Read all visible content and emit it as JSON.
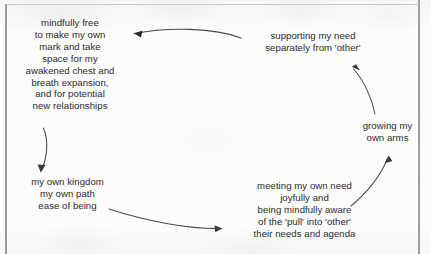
{
  "page": {
    "background_color": "#fbfbfa",
    "frame_color": "#8e8e90",
    "ink_color": "#3b3b40",
    "width": 431,
    "height": 254
  },
  "nodes": {
    "mindfully_free": {
      "label": "mindfully free\nto make my own\nmark and take\nspace for my\nawakened chest and\nbreath expansion,\nand for potential\nnew relationships",
      "position": "top-left"
    },
    "supporting_my_need": {
      "label": "supporting my need\nseparately from 'other'",
      "position": "top-right"
    },
    "growing_my_own_arms": {
      "label": "growing my\nown arms",
      "position": "middle-right"
    },
    "meeting_my_own_need": {
      "label": "meeting my own need\njoyfully and\nbeing mindfully aware\nof the 'pull' into 'other'\ntheir needs and agenda",
      "position": "bottom-right"
    },
    "my_own_kingdom": {
      "label": "my own kingdom\nmy own path\nease of being",
      "position": "bottom-left"
    }
  },
  "arrows": [
    {
      "name": "arrow-top-right-to-left",
      "from": "supporting_my_need",
      "to": "mindfully_free",
      "path": "M 241 38 C 214 27.5 168 27 134 33.5",
      "head": "M 134 33.5 L 141.5 31.2 L 140.2 36.8 Z",
      "multicolor": true,
      "color_stops": [
        "#3a3a42",
        "#2f7f74",
        "#c06c6c",
        "#6a62b5",
        "#4a4a80"
      ]
    },
    {
      "name": "arrow-left-down",
      "from": "mindfully_free",
      "to": "my_own_kingdom",
      "path": "M 43 128 C 49 142 46 160 40.5 171",
      "head": "M 40.5 171 L 44.5 165.5 L 38.2 165.0 Z",
      "multicolor": false,
      "color_stops": [
        "#4a4a50"
      ]
    },
    {
      "name": "arrow-bottom-left-to-right",
      "from": "my_own_kingdom",
      "to": "meeting_my_own_need",
      "path": "M 109 209 C 146 221 188 229 221 228.5",
      "head": "M 221 228.5 L 214.5 225.5 L 215.0 231.5 Z",
      "multicolor": false,
      "color_stops": [
        "#4a4a50"
      ]
    },
    {
      "name": "arrow-bottom-right-up",
      "from": "meeting_my_own_need",
      "to": "growing_my_own_arms",
      "path": "M 351 206 C 368 192 381 174 388.5 157",
      "head": "M 388.5 157 L 385.5 163.5 L 391.3 162.0 Z",
      "multicolor": false,
      "color_stops": [
        "#4a4a50"
      ]
    },
    {
      "name": "arrow-right-up-to-top",
      "from": "growing_my_own_arms",
      "to": "supporting_my_need",
      "path": "M 375 113 C 372 97 363 80 352.5 68",
      "head": "M 352.5 68 L 359.0 70.8 L 357.2 65.0 Z",
      "multicolor": false,
      "color_stops": [
        "#4a4a50"
      ]
    }
  ]
}
